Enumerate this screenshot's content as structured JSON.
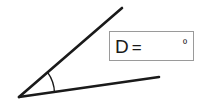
{
  "figure": {
    "type": "angle-diagram",
    "background_color": "#ffffff",
    "stroke_color": "#1a1a1a",
    "vertex": {
      "x": 19,
      "y": 97
    },
    "rays": [
      {
        "name": "upper-ray",
        "from": {
          "x": 19,
          "y": 97
        },
        "to": {
          "x": 122,
          "y": 8
        },
        "stroke_width": 2.6
      },
      {
        "name": "lower-ray",
        "from": {
          "x": 19,
          "y": 97
        },
        "to": {
          "x": 159,
          "y": 77
        },
        "stroke_width": 2.6
      }
    ],
    "angle_arc": {
      "name": "angle-arc",
      "radius": 36,
      "stroke_width": 1.4,
      "start": {
        "x": 47,
        "y": 73
      },
      "end": {
        "x": 55,
        "y": 93
      }
    }
  },
  "answer_box": {
    "border_color": "#9a9a9a",
    "variable_label": "D",
    "equals_sign": "=",
    "value": "",
    "placeholder": "",
    "unit_symbol": "º"
  }
}
